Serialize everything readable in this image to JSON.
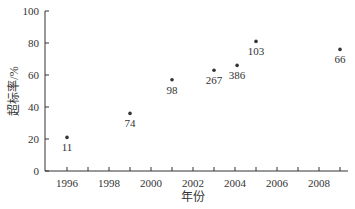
{
  "chart_data": {
    "type": "scatter",
    "title": "",
    "xlabel": "年份",
    "ylabel": "超标率/%",
    "xlim": [
      1995.0,
      2009.5
    ],
    "ylim": [
      0,
      100
    ],
    "x_ticks": [
      1996,
      1998,
      2000,
      2002,
      2004,
      2006,
      2008
    ],
    "x_minor_ticks": [
      1997,
      1999,
      2001,
      2003,
      2005,
      2007,
      2009
    ],
    "y_ticks": [
      0,
      20,
      40,
      60,
      80,
      100
    ],
    "grid": false,
    "legend": null,
    "points": [
      {
        "x": 1996,
        "y": 21,
        "label": "11",
        "label_pos": "below"
      },
      {
        "x": 1999,
        "y": 36,
        "label": "74",
        "label_pos": "below"
      },
      {
        "x": 2001,
        "y": 57,
        "label": "98",
        "label_pos": "below"
      },
      {
        "x": 2003,
        "y": 63,
        "label": "267",
        "label_pos": "below"
      },
      {
        "x": 2004.1,
        "y": 66,
        "label": "386",
        "label_pos": "below"
      },
      {
        "x": 2005,
        "y": 81,
        "label": "103",
        "label_pos": "below"
      },
      {
        "x": 2009,
        "y": 76,
        "label": "66",
        "label_pos": "below"
      }
    ]
  },
  "colors": {
    "axis": "#333333",
    "point": "#333333",
    "text": "#333333"
  }
}
